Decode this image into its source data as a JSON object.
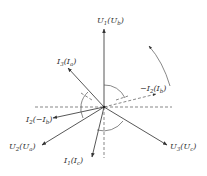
{
  "diagram": {
    "type": "phasor-diagram",
    "phasors": [
      {
        "id": "U1",
        "main": "U",
        "main_sub": "1",
        "paren": "U",
        "paren_sub": "b",
        "style": "solid",
        "dash": false
      },
      {
        "id": "I3",
        "main": "I",
        "main_sub": "3",
        "paren": "I",
        "paren_sub": "a",
        "style": "solid",
        "dash": false
      },
      {
        "id": "negI2",
        "main": "−I",
        "main_sub": "2",
        "paren": "I",
        "paren_sub": "b",
        "style": "dashed",
        "dash": true
      },
      {
        "id": "I2",
        "main": "I",
        "main_sub": "2",
        "paren": "−I",
        "paren_sub": "b",
        "style": "solid",
        "dash": false
      },
      {
        "id": "U2",
        "main": "U",
        "main_sub": "2",
        "paren": "U",
        "paren_sub": "a",
        "style": "solid",
        "dash": false
      },
      {
        "id": "I1",
        "main": "I",
        "main_sub": "1",
        "paren": "I",
        "paren_sub": "c",
        "style": "solid",
        "dash": false
      },
      {
        "id": "U3",
        "main": "U",
        "main_sub": "3",
        "paren": "U",
        "paren_sub": "c",
        "style": "solid",
        "dash": false
      }
    ],
    "rotation": "counter-clockwise",
    "colors": {
      "line": "#444444",
      "text": "#333333",
      "background": "#ffffff"
    }
  }
}
